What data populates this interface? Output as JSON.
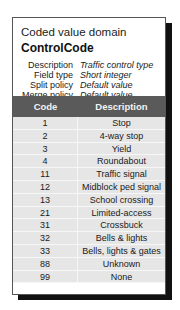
{
  "card": {
    "title": "Coded value domain",
    "name": "ControlCode",
    "properties": [
      {
        "label": "Description",
        "value": "Traffic control type"
      },
      {
        "label": "Field type",
        "value": "Short integer"
      },
      {
        "label": "Split policy",
        "value": "Default value"
      },
      {
        "label": "Merge policy",
        "value": "Default value"
      }
    ]
  },
  "table": {
    "headers": {
      "code": "Code",
      "description": "Description"
    },
    "rows": [
      {
        "code": "1",
        "description": "Stop"
      },
      {
        "code": "2",
        "description": "4-way stop"
      },
      {
        "code": "3",
        "description": "Yield"
      },
      {
        "code": "4",
        "description": "Roundabout"
      },
      {
        "code": "11",
        "description": "Traffic signal"
      },
      {
        "code": "12",
        "description": "Midblock ped signal"
      },
      {
        "code": "13",
        "description": "School crossing"
      },
      {
        "code": "21",
        "description": "Limited-access"
      },
      {
        "code": "31",
        "description": "Crossbuck"
      },
      {
        "code": "32",
        "description": "Bells & lights"
      },
      {
        "code": "33",
        "description": "Bells, lights & gates"
      },
      {
        "code": "88",
        "description": "Unknown"
      },
      {
        "code": "99",
        "description": "None"
      }
    ]
  }
}
